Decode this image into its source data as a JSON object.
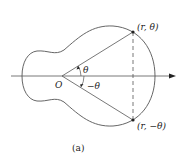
{
  "figure": {
    "caption": "(a)",
    "origin_label": "O",
    "angle_upper_label": "θ",
    "angle_lower_label": "−θ",
    "point_upper_label": "(r, θ)",
    "point_lower_label": "(r, −θ)",
    "colors": {
      "line": "#555555",
      "text": "#222222",
      "background": "#ffffff"
    }
  }
}
